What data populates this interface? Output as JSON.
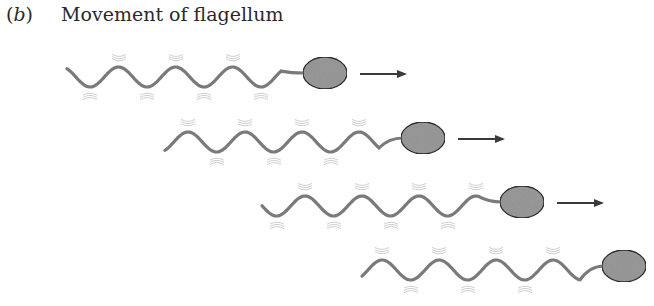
{
  "caption": {
    "label_open": "(",
    "label": "b",
    "label_close": ")",
    "title": "Movement of flagellum"
  },
  "style": {
    "tail_color": "#7a7a7a",
    "motion_line_color": "#c8c8c8",
    "body_fill": "#9a9a9a",
    "body_stroke": "#2e2e2e",
    "arrow_color": "#3a3a3a"
  },
  "cells": [
    {
      "tail_start_x": 67,
      "body_cx": 325,
      "body_cy": 73,
      "wavelength": 57,
      "amplitude": 10,
      "phase": 0,
      "arrow": true
    },
    {
      "tail_start_x": 165,
      "body_cx": 423,
      "body_cy": 138,
      "wavelength": 57,
      "amplitude": 10,
      "phase": 0.5,
      "arrow": true
    },
    {
      "tail_start_x": 262,
      "body_cx": 522,
      "body_cy": 202,
      "wavelength": 57,
      "amplitude": 10,
      "phase": 0.15,
      "arrow": true
    },
    {
      "tail_start_x": 362,
      "body_cx": 624,
      "body_cy": 266,
      "wavelength": 57,
      "amplitude": 10,
      "phase": 0.55,
      "arrow": false
    }
  ]
}
